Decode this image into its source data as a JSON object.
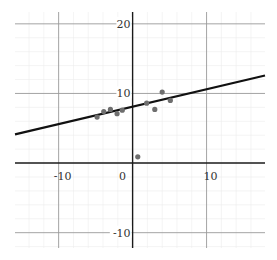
{
  "chart_data": {
    "type": "scatter",
    "title": "",
    "xlabel": "",
    "ylabel": "",
    "xlim": [
      -15.9,
      17.9
    ],
    "ylim": [
      -12.2,
      21.7
    ],
    "grid": true,
    "minor_grid_step": 2,
    "major_grid_step": 10,
    "x_tick_labels": [
      "-10",
      "0",
      "10"
    ],
    "y_tick_labels": [
      "20",
      "10",
      "-10"
    ],
    "x_ticks": [
      -10,
      0,
      10
    ],
    "y_ticks": [
      20,
      10,
      -10
    ],
    "series": [
      {
        "name": "data points",
        "type": "scatter",
        "color": "#6e6e6e",
        "points": [
          {
            "x": -4.8,
            "y": 6.6
          },
          {
            "x": -3.9,
            "y": 7.4
          },
          {
            "x": -3.0,
            "y": 7.7
          },
          {
            "x": -2.1,
            "y": 7.1
          },
          {
            "x": -1.4,
            "y": 7.6
          },
          {
            "x": 0.7,
            "y": 0.9
          },
          {
            "x": 1.9,
            "y": 8.6
          },
          {
            "x": 3.0,
            "y": 7.7
          },
          {
            "x": 4.0,
            "y": 10.2
          },
          {
            "x": 5.1,
            "y": 9.0
          }
        ]
      },
      {
        "name": "regression line",
        "type": "line",
        "color": "#111111",
        "slope": 0.25,
        "intercept": 8.1,
        "x_range": [
          -15.9,
          17.9
        ]
      }
    ],
    "legend": null
  }
}
